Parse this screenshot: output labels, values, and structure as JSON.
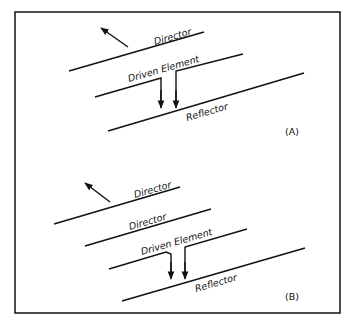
{
  "figure": {
    "frame": {
      "x": 15,
      "y": 12,
      "width": 325,
      "height": 301
    },
    "panels": [
      {
        "id": "A",
        "tag": "(A)",
        "labels": {
          "director": "Director",
          "driven": "Driven Element",
          "reflector": "Reflector"
        },
        "elements": [
          "Director",
          "Driven Element",
          "Reflector"
        ]
      },
      {
        "id": "B",
        "tag": "(B)",
        "labels": {
          "director1": "Director",
          "director2": "Director",
          "driven": "Driven Element",
          "reflector": "Reflector"
        },
        "elements": [
          "Director",
          "Director",
          "Driven Element",
          "Reflector"
        ]
      }
    ]
  }
}
